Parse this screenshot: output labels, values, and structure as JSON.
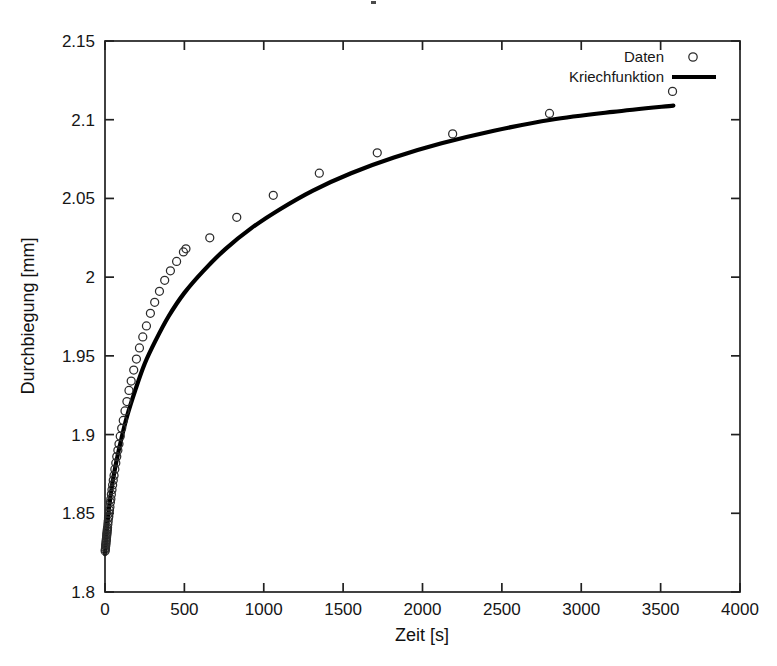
{
  "figure": {
    "title": "",
    "background_color": "#ffffff",
    "foreground_color": "#000000"
  },
  "axes": {
    "x_title": "Zeit [s]",
    "y_title": "Durchbiegung [mm]",
    "x_ticks": [
      "0",
      "500",
      "1000",
      "1500",
      "2000",
      "2500",
      "3000",
      "3500",
      "4000"
    ],
    "y_ticks": [
      "1.8",
      "1.85",
      "1.9",
      "1.95",
      "2",
      "2.05",
      "2.1",
      "2.15"
    ]
  },
  "legend": {
    "position": "top-right-inside",
    "entries": [
      {
        "label": "Daten",
        "marker": "open-circle",
        "color": "#2b2b2b"
      },
      {
        "label": "Kriechfunktion",
        "marker": "solid-line",
        "color": "#000000"
      }
    ]
  },
  "chart_data": {
    "type": "scatter",
    "title": "",
    "xlabel": "Zeit [s]",
    "ylabel": "Durchbiegung [mm]",
    "xlim": [
      0,
      4000
    ],
    "ylim": [
      1.8,
      2.15
    ],
    "xticks": [
      0,
      500,
      1000,
      1500,
      2000,
      2500,
      3000,
      3500,
      4000
    ],
    "yticks": [
      1.8,
      1.85,
      1.9,
      1.95,
      2.0,
      2.05,
      2.1,
      2.15
    ],
    "grid": false,
    "legend_position": "upper right",
    "series": [
      {
        "name": "Daten",
        "type": "scatter",
        "marker": "open-circle",
        "color": "#2b2b2b",
        "x": [
          1,
          2,
          3,
          4,
          5,
          6,
          7,
          8,
          9,
          10,
          11,
          12,
          13,
          14,
          15,
          16,
          18,
          20,
          22,
          24,
          26,
          28,
          31,
          34,
          37,
          40,
          44,
          48,
          52,
          57,
          62,
          68,
          74,
          81,
          88,
          96,
          105,
          115,
          126,
          138,
          151,
          165,
          181,
          198,
          217,
          238,
          261,
          286,
          313,
          343,
          376,
          412,
          451,
          494,
          510,
          660,
          830,
          1060,
          1350,
          1715,
          2190,
          2800,
          3575
        ],
        "y": [
          1.826,
          1.827,
          1.828,
          1.829,
          1.83,
          1.831,
          1.832,
          1.833,
          1.834,
          1.835,
          1.836,
          1.837,
          1.838,
          1.839,
          1.84,
          1.841,
          1.843,
          1.845,
          1.847,
          1.848,
          1.85,
          1.852,
          1.854,
          1.857,
          1.859,
          1.862,
          1.865,
          1.868,
          1.871,
          1.874,
          1.878,
          1.882,
          1.886,
          1.89,
          1.894,
          1.899,
          1.904,
          1.909,
          1.915,
          1.921,
          1.928,
          1.934,
          1.941,
          1.948,
          1.955,
          1.962,
          1.969,
          1.977,
          1.984,
          1.991,
          1.998,
          2.004,
          2.01,
          2.016,
          2.018,
          2.025,
          2.038,
          2.052,
          2.066,
          2.079,
          2.091,
          2.104,
          2.118
        ]
      },
      {
        "name": "Kriechfunktion",
        "type": "line",
        "color": "#000000",
        "x": [
          0,
          10,
          25,
          45,
          70,
          100,
          140,
          190,
          250,
          320,
          400,
          500,
          620,
          760,
          920,
          1100,
          1310,
          1550,
          1820,
          2120,
          2450,
          2810,
          3200,
          3580
        ],
        "y": [
          1.824,
          1.838,
          1.853,
          1.868,
          1.882,
          1.896,
          1.912,
          1.928,
          1.945,
          1.96,
          1.975,
          1.99,
          2.004,
          2.018,
          2.031,
          2.043,
          2.055,
          2.066,
          2.076,
          2.085,
          2.093,
          2.1,
          2.105,
          2.109
        ]
      }
    ]
  }
}
